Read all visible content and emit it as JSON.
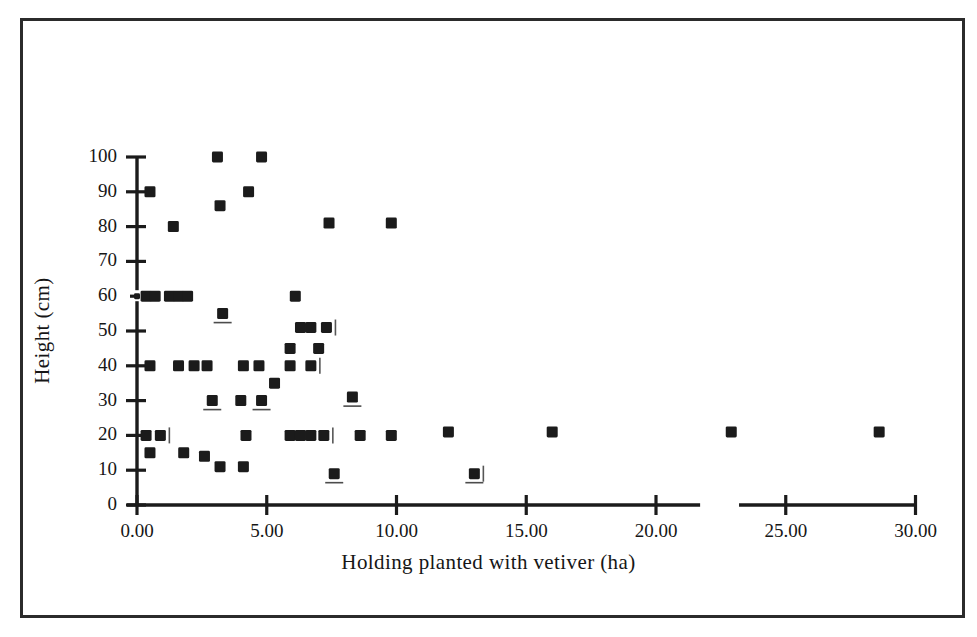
{
  "chart_data": {
    "type": "scatter",
    "title": "",
    "xlabel": "Holding planted with vetiver (ha)",
    "ylabel": "Height (cm)",
    "xlim": [
      0,
      30
    ],
    "ylim": [
      0,
      100
    ],
    "grid": false,
    "legend": null,
    "xticks": [
      0,
      5,
      10,
      15,
      20,
      25,
      30
    ],
    "xtick_labels": [
      "0.00",
      "5.00",
      "10.00",
      "15.00",
      "20.00",
      "25.00",
      "30.00"
    ],
    "yticks": [
      0,
      10,
      20,
      30,
      40,
      50,
      60,
      70,
      80,
      90,
      100
    ],
    "ytick_labels": [
      "0",
      "10",
      "20",
      "30",
      "40",
      "50",
      "60",
      "70",
      "80",
      "90",
      "100"
    ],
    "axis_break": {
      "present": true,
      "between": [
        21.7,
        23.2
      ],
      "axis": "x"
    },
    "marker": "filled-square",
    "marker_color": "#1b1b1b",
    "points": [
      {
        "x": 3.1,
        "y": 100
      },
      {
        "x": 4.8,
        "y": 100
      },
      {
        "x": 0.5,
        "y": 90
      },
      {
        "x": 4.3,
        "y": 90
      },
      {
        "x": 3.2,
        "y": 86
      },
      {
        "x": 1.4,
        "y": 80
      },
      {
        "x": 7.4,
        "y": 81
      },
      {
        "x": 9.8,
        "y": 81
      },
      {
        "x": 0.0,
        "y": 60
      },
      {
        "x": 0.35,
        "y": 60
      },
      {
        "x": 0.7,
        "y": 60
      },
      {
        "x": 1.25,
        "y": 60
      },
      {
        "x": 1.6,
        "y": 60
      },
      {
        "x": 1.95,
        "y": 60
      },
      {
        "x": 6.1,
        "y": 60
      },
      {
        "x": 3.3,
        "y": 55
      },
      {
        "x": 6.3,
        "y": 51
      },
      {
        "x": 6.7,
        "y": 51
      },
      {
        "x": 7.3,
        "y": 51
      },
      {
        "x": 5.9,
        "y": 45
      },
      {
        "x": 7.0,
        "y": 45
      },
      {
        "x": 0.5,
        "y": 40
      },
      {
        "x": 1.6,
        "y": 40
      },
      {
        "x": 2.2,
        "y": 40
      },
      {
        "x": 2.7,
        "y": 40
      },
      {
        "x": 4.1,
        "y": 40
      },
      {
        "x": 4.7,
        "y": 40
      },
      {
        "x": 5.9,
        "y": 40
      },
      {
        "x": 6.7,
        "y": 40
      },
      {
        "x": 5.3,
        "y": 35
      },
      {
        "x": 2.9,
        "y": 30
      },
      {
        "x": 4.0,
        "y": 30
      },
      {
        "x": 4.8,
        "y": 30
      },
      {
        "x": 8.3,
        "y": 31
      },
      {
        "x": 0.35,
        "y": 20
      },
      {
        "x": 0.9,
        "y": 20
      },
      {
        "x": 4.2,
        "y": 20
      },
      {
        "x": 5.9,
        "y": 20
      },
      {
        "x": 6.3,
        "y": 20
      },
      {
        "x": 6.7,
        "y": 20
      },
      {
        "x": 7.2,
        "y": 20
      },
      {
        "x": 8.6,
        "y": 20
      },
      {
        "x": 9.8,
        "y": 20
      },
      {
        "x": 12.0,
        "y": 21
      },
      {
        "x": 16.0,
        "y": 21
      },
      {
        "x": 22.9,
        "y": 21
      },
      {
        "x": 28.6,
        "y": 21
      },
      {
        "x": 0.5,
        "y": 15
      },
      {
        "x": 1.8,
        "y": 15
      },
      {
        "x": 2.6,
        "y": 14
      },
      {
        "x": 3.2,
        "y": 11
      },
      {
        "x": 4.1,
        "y": 11
      },
      {
        "x": 7.6,
        "y": 9
      },
      {
        "x": 13.0,
        "y": 9
      }
    ]
  },
  "figure": {
    "frame_color": "#2b2b2b",
    "background": "#ffffff"
  }
}
